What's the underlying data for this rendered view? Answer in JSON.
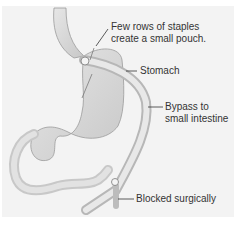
{
  "diagram": {
    "type": "anatomical-illustration",
    "labels": {
      "staples": [
        "Few rows of staples",
        "create a small pouch."
      ],
      "stomach": "Stomach",
      "bypass": [
        "Bypass to",
        "small intestine"
      ],
      "blocked": "Blocked surgically"
    },
    "colors": {
      "background": "#f3f3f3",
      "organ_fill": "#d9d9d9",
      "organ_outline": "#9a9a9a",
      "text": "#333333"
    }
  }
}
